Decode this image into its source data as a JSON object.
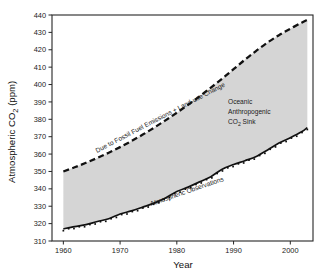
{
  "chart_data": {
    "type": "area",
    "title": "",
    "xlabel": "Year",
    "ylabel": "Atmospheric CO2 (ppm)",
    "ylabel_main": "Atmospheric CO",
    "ylabel_sub": "2",
    "ylabel_tail": " (ppm)",
    "xlim": [
      1958,
      2004
    ],
    "ylim": [
      310,
      440
    ],
    "yticks": [
      310,
      320,
      330,
      340,
      350,
      360,
      370,
      380,
      390,
      400,
      410,
      420,
      430,
      440
    ],
    "xticks": [
      1960,
      1970,
      1980,
      1990,
      2000
    ],
    "grid": false,
    "legend_position": "in-plot-annotations",
    "x": [
      1960,
      1962,
      1964,
      1966,
      1968,
      1970,
      1972,
      1974,
      1976,
      1978,
      1980,
      1982,
      1984,
      1986,
      1988,
      1990,
      1992,
      1994,
      1996,
      1998,
      2000,
      2002,
      2003
    ],
    "series": [
      {
        "name": "Due to Fossil Fuel Emissions + Land-use Change",
        "style": "dashed",
        "values": [
          350.0,
          352.4,
          355.0,
          357.8,
          360.8,
          364.0,
          367.5,
          371.2,
          375.2,
          379.4,
          383.8,
          388.4,
          393.2,
          398.2,
          403.4,
          408.8,
          414.3,
          419.4,
          424.2,
          428.4,
          432.1,
          435.6,
          437.2
        ]
      },
      {
        "name": "Atmospheric Observations",
        "style": "solid-with-markers",
        "values": [
          317.0,
          318.3,
          319.4,
          321.2,
          322.8,
          325.5,
          327.3,
          329.5,
          331.8,
          334.8,
          338.5,
          341.0,
          344.0,
          347.0,
          351.3,
          354.0,
          356.2,
          358.6,
          362.4,
          366.4,
          369.4,
          372.8,
          375.2
        ]
      }
    ],
    "band_label": "Oceanic Anthropogenic CO2 Sink",
    "annotations": [
      {
        "id": "upper-curve-label",
        "text": "Due to Fossil Fuel Emissions + Land-use Change"
      },
      {
        "id": "band-label-line1",
        "text": "Oceanic"
      },
      {
        "id": "band-label-line2",
        "text": "Anthropogenic"
      },
      {
        "id": "band-label-line3-main",
        "text": "CO"
      },
      {
        "id": "band-label-line3-sub",
        "text": "2"
      },
      {
        "id": "band-label-line3-tail",
        "text": " Sink"
      },
      {
        "id": "lower-curve-label",
        "text": "Atmospheric Observations"
      }
    ]
  },
  "colors": {
    "band_fill": "#d5d5d5",
    "line": "#111111",
    "axis": "#262626",
    "background": "#ffffff"
  }
}
